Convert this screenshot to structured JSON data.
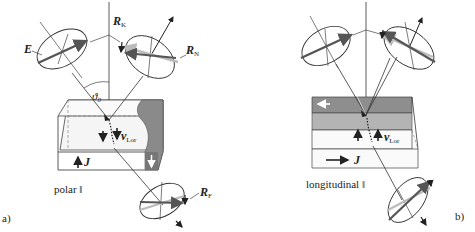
{
  "figure": {
    "panel_a": {
      "tag": "a)",
      "caption": "polar ‖",
      "labels": {
        "incident_field": "E",
        "kerr_component": "R",
        "kerr_sub": "K",
        "normal_component": "R",
        "normal_sub": "N",
        "faraday_component": "R",
        "faraday_sub": "F",
        "angle": "ϑ",
        "angle_sub": "0",
        "lorentz_velocity": "v",
        "lorentz_sub": "Lor",
        "current": "J"
      }
    },
    "panel_b": {
      "tag": "b)",
      "caption": "longitudinal ‖",
      "labels": {
        "lorentz_velocity": "v",
        "lorentz_sub": "Lor",
        "current": "J"
      }
    },
    "colors": {
      "line": "#333333",
      "arrow_dark": "#555555",
      "arrow_light": "#aaaaaa",
      "domain_dark": "#7d7d7d",
      "domain_mid": "#a8a8a8",
      "box_face": "#f4f4f4"
    }
  }
}
